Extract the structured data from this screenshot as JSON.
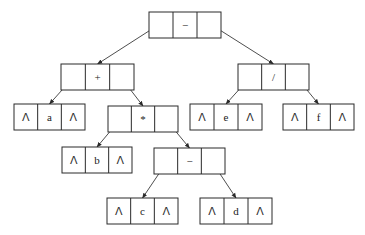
{
  "diagram": {
    "type": "binary expression tree (linked list representation)",
    "nil_symbol": "Λ",
    "nodes": [
      {
        "id": "root",
        "value": "−",
        "x": 149,
        "y": 12,
        "w": 72,
        "h": 26,
        "left": "plus",
        "right": "div"
      },
      {
        "id": "plus",
        "value": "+",
        "x": 61,
        "y": 64,
        "w": 73,
        "h": 26,
        "left": "a",
        "right": "mul"
      },
      {
        "id": "div",
        "value": "/",
        "x": 238,
        "y": 64,
        "w": 71,
        "h": 26,
        "left": "e",
        "right": "f"
      },
      {
        "id": "a",
        "value": "a",
        "x": 14,
        "y": 104,
        "w": 71,
        "h": 26,
        "left": null,
        "right": null
      },
      {
        "id": "mul",
        "value": "*",
        "x": 108,
        "y": 106,
        "w": 70,
        "h": 26,
        "left": "b",
        "right": "minus2"
      },
      {
        "id": "e",
        "value": "e",
        "x": 190,
        "y": 104,
        "w": 72,
        "h": 26,
        "left": null,
        "right": null
      },
      {
        "id": "f",
        "value": "f",
        "x": 283,
        "y": 104,
        "w": 71,
        "h": 26,
        "left": null,
        "right": null
      },
      {
        "id": "b",
        "value": "b",
        "x": 62,
        "y": 147,
        "w": 70,
        "h": 26,
        "left": null,
        "right": null
      },
      {
        "id": "minus2",
        "value": "−",
        "x": 154,
        "y": 148,
        "w": 71,
        "h": 26,
        "left": "c",
        "right": "d"
      },
      {
        "id": "c",
        "value": "c",
        "x": 107,
        "y": 198,
        "w": 71,
        "h": 26,
        "left": null,
        "right": null
      },
      {
        "id": "d",
        "value": "d",
        "x": 200,
        "y": 198,
        "w": 72,
        "h": 26,
        "left": null,
        "right": null
      }
    ]
  }
}
